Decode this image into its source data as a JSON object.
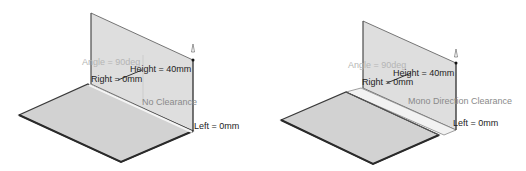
{
  "figures": [
    {
      "id": "left",
      "labels": {
        "angle": "Angle = 90deg",
        "height": "Height = 40mm",
        "right": "Right = 0mm",
        "clearance": "No Clearance",
        "left": "Left = 0mm"
      }
    },
    {
      "id": "right",
      "labels": {
        "angle": "Angle = 90deg",
        "height": "Height = 40mm",
        "right": "Right = 0mm",
        "clearance": "Mono Direction Clearance",
        "left": "Left = 0mm"
      }
    }
  ],
  "colors": {
    "face": "#d4d4d4",
    "wall": "#dedede",
    "edge": "#3a3a3a",
    "clearance_strip": "#f2f2f2"
  }
}
